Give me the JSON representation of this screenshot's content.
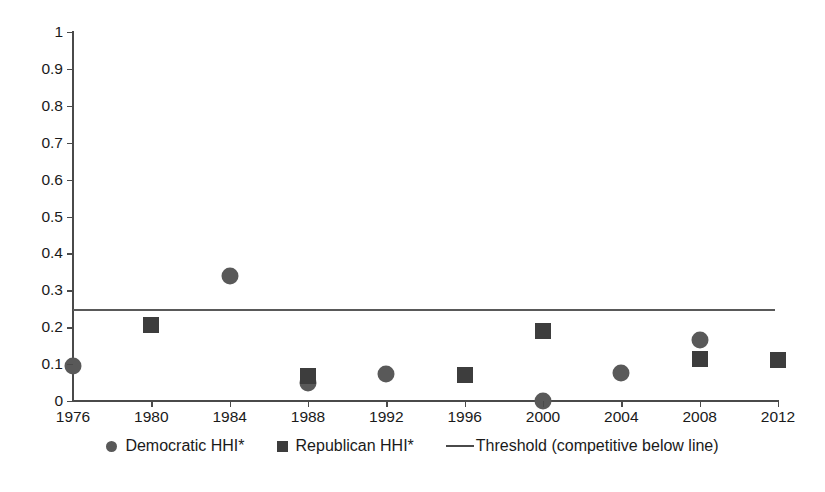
{
  "chart_data": {
    "type": "scatter",
    "title": "",
    "subtitle": "",
    "xlabel": "",
    "ylabel": "",
    "x": [
      1976,
      1980,
      1984,
      1988,
      1992,
      1996,
      2000,
      2004,
      2008,
      2012
    ],
    "categories": [
      "1976",
      "1980",
      "1984",
      "1988",
      "1992",
      "1996",
      "2000",
      "2004",
      "2008",
      "2012"
    ],
    "xlim": [
      1976,
      2012
    ],
    "ylim": [
      0,
      1
    ],
    "ytick_labels": [
      "0",
      "0.1",
      "0.2",
      "0.3",
      "0.4",
      "0.5",
      "0.6",
      "0.7",
      "0.8",
      "0.9",
      "1"
    ],
    "ytick_values": [
      0,
      0.1,
      0.2,
      0.3,
      0.4,
      0.5,
      0.6,
      0.7,
      0.8,
      0.9,
      1
    ],
    "grid": false,
    "legend_position": "bottom",
    "series": [
      {
        "name": "Democratic HHI*",
        "marker": "circle",
        "color": "#595959",
        "points": [
          {
            "x": 1976,
            "y": 0.095
          },
          {
            "x": 1984,
            "y": 0.34
          },
          {
            "x": 1988,
            "y": 0.05
          },
          {
            "x": 1992,
            "y": 0.072
          },
          {
            "x": 2000,
            "y": 0.0
          },
          {
            "x": 2004,
            "y": 0.076
          },
          {
            "x": 2008,
            "y": 0.165
          }
        ]
      },
      {
        "name": "Republican HHI*",
        "marker": "square",
        "color": "#3d3d3d",
        "points": [
          {
            "x": 1980,
            "y": 0.207
          },
          {
            "x": 1988,
            "y": 0.068
          },
          {
            "x": 1996,
            "y": 0.07
          },
          {
            "x": 2000,
            "y": 0.19
          },
          {
            "x": 2008,
            "y": 0.114
          },
          {
            "x": 2012,
            "y": 0.111
          }
        ]
      }
    ],
    "threshold": {
      "name": "Threshold (competitive below line)",
      "value": 0.25,
      "color": "#595959"
    }
  },
  "legend": {
    "items": [
      {
        "label": "Democratic HHI*",
        "swatch": "circle-marker-icon"
      },
      {
        "label": "Republican HHI*",
        "swatch": "square-marker-icon"
      },
      {
        "label": "Threshold (competitive below line)",
        "swatch": "line-swatch-icon"
      }
    ]
  }
}
